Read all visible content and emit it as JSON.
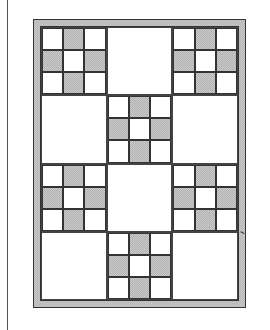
{
  "diagram": {
    "type": "quilt-layout",
    "grid": {
      "rows": 4,
      "columns": 3
    },
    "colors": {
      "shade": "#c8c8c8",
      "background": "#ffffff",
      "line": "#333333"
    },
    "nine_patch_pattern": [
      [
        false,
        true,
        false
      ],
      [
        true,
        false,
        true
      ],
      [
        false,
        true,
        false
      ]
    ],
    "blocks": [
      [
        "nine-patch",
        "plain",
        "nine-patch"
      ],
      [
        "plain",
        "nine-patch",
        "plain"
      ],
      [
        "nine-patch",
        "plain",
        "nine-patch"
      ],
      [
        "plain",
        "nine-patch",
        "plain"
      ]
    ]
  }
}
